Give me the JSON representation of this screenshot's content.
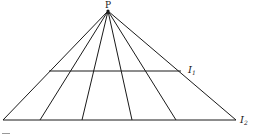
{
  "diagram": {
    "apex": {
      "label": "P",
      "x": 108,
      "y": 11
    },
    "rays_bottom_x": [
      3,
      40,
      82,
      132,
      176,
      236
    ],
    "lines": [
      {
        "id": "I1",
        "label": "I",
        "subscript": "1",
        "y": 71,
        "x1": 49,
        "x2": 181
      },
      {
        "id": "I2",
        "label": "I",
        "subscript": "2",
        "y": 120,
        "x1": 3,
        "x2": 236
      }
    ],
    "colors": {
      "stroke": "#1a1a1a",
      "background": "#ffffff"
    }
  }
}
